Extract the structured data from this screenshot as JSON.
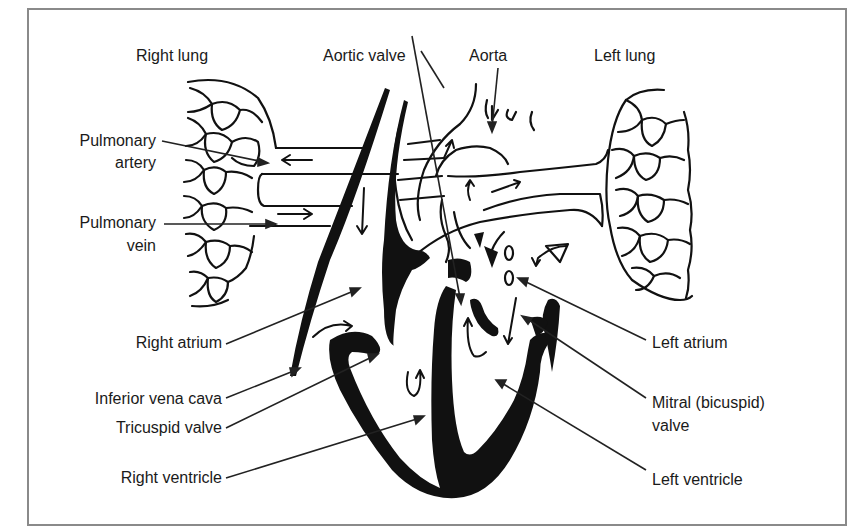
{
  "figure": {
    "labels": {
      "right_lung": "Right lung",
      "aortic_valve": "Aortic valve",
      "aorta": "Aorta",
      "left_lung": "Left lung",
      "pulmonary_artery_1": "Pulmonary",
      "pulmonary_artery_2": "artery",
      "pulmonary_vein_1": "Pulmonary",
      "pulmonary_vein_2": "vein",
      "right_atrium": "Right atrium",
      "inferior_vena_cava": "Inferior vena cava",
      "tricuspid_valve": "Tricuspid valve",
      "right_ventricle": "Right ventricle",
      "left_atrium": "Left atrium",
      "mitral_valve_1": "Mitral (bicuspid)",
      "mitral_valve_2": "valve",
      "left_ventricle": "Left ventricle"
    },
    "colors": {
      "ink": "#111111",
      "frame": "#8a8a8a",
      "background": "#ffffff"
    }
  }
}
